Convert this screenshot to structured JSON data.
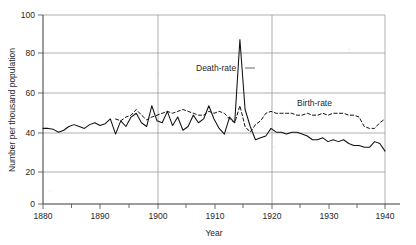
{
  "chart_data": {
    "type": "line",
    "title": "",
    "xlabel": "Year",
    "ylabel": "Number per thousand population",
    "xlim": [
      1880,
      1946
    ],
    "ylim": [
      0,
      100
    ],
    "grid": true,
    "legend_position": "inline-annotations",
    "xticks": [
      1880,
      1890,
      1900,
      1910,
      1920,
      1930,
      1940
    ],
    "xticks_minor": [
      1885,
      1895,
      1905,
      1915,
      1925,
      1935,
      1945
    ],
    "yticks": [
      0,
      20,
      40,
      60,
      80,
      100
    ],
    "annotations": [
      {
        "text": "Death-rate",
        "x": 1911,
        "y": 72
      },
      {
        "text": "Birth-rate",
        "x": 1929,
        "y": 58
      }
    ],
    "series": [
      {
        "name": "Death-rate",
        "style": "solid",
        "x": [
          1880,
          1881,
          1882,
          1883,
          1884,
          1885,
          1886,
          1887,
          1888,
          1889,
          1890,
          1891,
          1892,
          1893,
          1894,
          1895,
          1896,
          1897,
          1898,
          1899,
          1900,
          1901,
          1902,
          1903,
          1904,
          1905,
          1906,
          1907,
          1908,
          1909,
          1910,
          1911,
          1912,
          1913,
          1914,
          1915,
          1916,
          1917,
          1918,
          1919,
          1920,
          1921,
          1922,
          1923,
          1924,
          1925,
          1926,
          1927,
          1928,
          1929,
          1930,
          1931,
          1932,
          1933,
          1934,
          1935,
          1936,
          1937,
          1938,
          1939,
          1940,
          1941,
          1942,
          1943,
          1944,
          1945,
          1946
        ],
        "values": [
          40,
          40,
          39.5,
          38,
          39,
          41,
          42,
          41,
          40,
          42,
          43,
          41.5,
          42.5,
          45,
          37,
          44,
          41,
          46,
          48,
          43,
          41,
          52,
          44,
          43,
          49,
          41.5,
          46,
          39,
          41,
          47,
          43,
          45,
          52,
          45,
          40,
          37,
          46,
          43,
          87,
          50,
          41,
          34,
          35,
          36,
          40,
          38,
          38,
          37,
          38,
          38,
          37,
          36,
          34,
          34,
          35,
          33,
          34,
          33,
          34,
          32,
          31,
          31,
          30,
          30,
          33,
          32,
          28
        ]
      },
      {
        "name": "Birth-rate",
        "style": "dashed",
        "x": [
          1894,
          1895,
          1896,
          1897,
          1898,
          1899,
          1900,
          1901,
          1902,
          1903,
          1904,
          1905,
          1906,
          1907,
          1908,
          1909,
          1910,
          1911,
          1912,
          1913,
          1914,
          1915,
          1916,
          1917,
          1918,
          1919,
          1920,
          1921,
          1922,
          1923,
          1924,
          1925,
          1926,
          1927,
          1928,
          1929,
          1930,
          1931,
          1932,
          1933,
          1934,
          1935,
          1936,
          1937,
          1938,
          1939,
          1940,
          1941,
          1942,
          1943,
          1944,
          1945,
          1946
        ],
        "values": [
          45,
          44,
          46,
          47,
          50,
          47,
          44.5,
          46,
          47,
          48,
          49,
          48,
          49,
          50,
          49,
          48,
          47,
          47,
          49,
          48,
          49,
          48,
          45,
          43,
          52,
          41,
          38,
          42,
          44,
          48,
          49,
          48,
          48,
          48,
          48,
          47,
          47,
          48,
          47,
          47,
          48,
          47,
          48,
          48,
          48,
          47,
          47,
          46,
          41,
          40,
          40,
          43,
          45
        ]
      }
    ]
  },
  "axes": {
    "ylabel": "Number per thousand population",
    "xlabel": "Year",
    "ytick_labels": [
      "0",
      "20",
      "40",
      "60",
      "80",
      "100"
    ],
    "xtick_labels": [
      "1880",
      "1890",
      "1900",
      "1910",
      "1920",
      "1930",
      "1940"
    ]
  },
  "labels": {
    "death_rate": "Death-rate",
    "birth_rate": "Birth-rate"
  },
  "colors": {
    "line": "#111111",
    "grid": "#8d8d8d",
    "axis": "#3a3a3a",
    "text": "#1f1f1f",
    "background": "#ffffff"
  }
}
